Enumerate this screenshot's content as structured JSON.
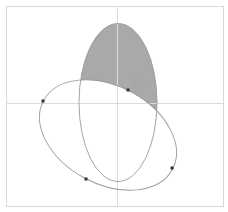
{
  "diagram": {
    "type": "ellipse-intersection",
    "frame": {
      "x": 6,
      "y": 6,
      "width": 217,
      "height": 200,
      "stroke": "#d8d8d8"
    },
    "axes": {
      "color": "#dcdcdc",
      "vertical_x": 117,
      "horizontal_y": 103
    },
    "shaded_region": {
      "fill": "#a9a9a9",
      "description": "Region inside tall ellipse and outside tilted ellipse, upper part"
    },
    "ellipses": [
      {
        "name": "tall-ellipse",
        "cx": 118,
        "cy": 102.5,
        "rx": 39,
        "ry": 79,
        "rotation": 0,
        "stroke": "#9a9a9a"
      },
      {
        "name": "tilted-ellipse",
        "cx": 108,
        "cy": 135,
        "rx": 73,
        "ry": 49,
        "rotation": 28,
        "stroke": "#9a9a9a"
      }
    ],
    "points": [
      {
        "name": "point-a",
        "x": 43,
        "y": 101
      },
      {
        "name": "point-b",
        "x": 86,
        "y": 179
      },
      {
        "name": "point-c",
        "x": 172,
        "y": 168
      },
      {
        "name": "point-d",
        "x": 128,
        "y": 90
      }
    ],
    "ghost_marker": {
      "x": 139,
      "y": 84,
      "r": 5,
      "color": "#9c9c9c"
    },
    "point_color": "#333333"
  }
}
